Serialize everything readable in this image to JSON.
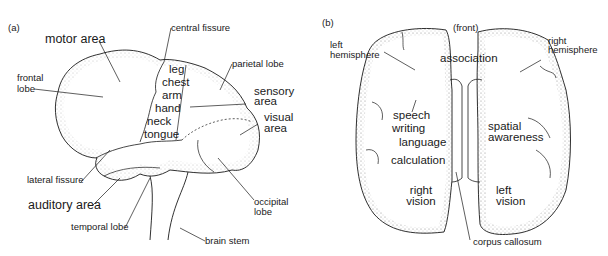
{
  "panel_a": {
    "tag": "(a)",
    "title": "Lateral view of left cerebral hemisphere",
    "labels": {
      "motor_area": "motor area",
      "central_fissure": "central fissure",
      "frontal_lobe_1": "frontal",
      "frontal_lobe_2": "lobe",
      "parietal_lobe": "parietal lobe",
      "sensory_area_1": "sensory",
      "sensory_area_2": "area",
      "visual_area_1": "visual",
      "visual_area_2": "area",
      "lateral_fissure": "lateral fissure",
      "auditory_area": "auditory area",
      "temporal_lobe": "temporal lobe",
      "occipital_lobe_1": "occipital",
      "occipital_lobe_2": "lobe",
      "brain_stem": "brain stem"
    },
    "body_map": [
      "leg",
      "chest",
      "arm",
      "hand",
      "neck",
      "tongue"
    ]
  },
  "panel_b": {
    "tag": "(b)",
    "title": "Top view of both hemispheres",
    "front": "(front)",
    "labels": {
      "left_hemisphere_1": "left",
      "left_hemisphere_2": "hemisphere",
      "right_hemisphere_1": "right",
      "right_hemisphere_2": "hemisphere",
      "association": "association",
      "corpus_callosum": "corpus callosum"
    },
    "left_functions": [
      "speech",
      "writing",
      "language",
      "calculation"
    ],
    "left_vision": [
      "right",
      "vision"
    ],
    "right_functions": [
      "spatial",
      "awareness"
    ],
    "right_vision": [
      "left",
      "vision"
    ]
  },
  "colors": {
    "ink": "#1a1a1a",
    "stipple": "#8a8a8a",
    "background": "#ffffff"
  }
}
